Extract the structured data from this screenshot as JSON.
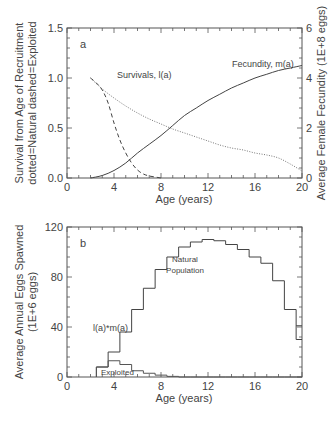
{
  "chart_data": [
    {
      "type": "line",
      "panel_label": "a",
      "xlabel": "Age (years)",
      "ylabel_line1": "Survival from Age of Recruitment",
      "ylabel_line2": "dotted=Natural  dashed=Exploited",
      "ylabel_right": "Average Female Fecundity (1E+8 eggs)",
      "xlim": [
        0,
        20
      ],
      "ylim": [
        0,
        1.5
      ],
      "ylim_right": [
        0,
        6
      ],
      "x_ticks": [
        "0",
        "4",
        "8",
        "12",
        "16",
        "20"
      ],
      "y_ticks": [
        "0.0",
        "0.5",
        "1.0",
        "1.5"
      ],
      "y_ticks_right": [
        "0",
        "2",
        "4",
        "6"
      ],
      "annotations": {
        "survivals": "Survivals, l(a)",
        "fecundity": "Fecundity, m(a)"
      },
      "series": [
        {
          "name": "Natural survival (dotted)",
          "axis": "left",
          "style": "dotted",
          "x": [
            2,
            3,
            4,
            5,
            6,
            7,
            8,
            9,
            10,
            11,
            12,
            13,
            14,
            15,
            16,
            17,
            18,
            19,
            20
          ],
          "values": [
            1.0,
            0.89,
            0.8,
            0.72,
            0.65,
            0.59,
            0.54,
            0.49,
            0.45,
            0.41,
            0.37,
            0.33,
            0.3,
            0.28,
            0.25,
            0.23,
            0.2,
            0.14,
            0.07
          ]
        },
        {
          "name": "Exploited survival (dashed)",
          "axis": "left",
          "style": "dashed",
          "x": [
            2,
            2.5,
            3,
            3.5,
            4,
            4.5,
            5,
            5.5,
            6,
            6.5,
            7,
            7.5,
            8
          ],
          "values": [
            1.0,
            0.95,
            0.88,
            0.75,
            0.55,
            0.38,
            0.25,
            0.15,
            0.08,
            0.04,
            0.02,
            0.01,
            0.0
          ]
        },
        {
          "name": "Fecundity m(a) (solid)",
          "axis": "right",
          "style": "solid",
          "x": [
            2,
            3,
            4,
            5,
            6,
            7,
            8,
            9,
            10,
            11,
            12,
            13,
            14,
            15,
            16,
            17,
            18,
            19,
            20
          ],
          "values": [
            0.0,
            0.1,
            0.3,
            0.6,
            1.0,
            1.35,
            1.7,
            2.1,
            2.5,
            2.8,
            3.1,
            3.35,
            3.6,
            3.8,
            4.0,
            4.15,
            4.3,
            4.4,
            4.5
          ]
        }
      ]
    },
    {
      "type": "bar",
      "subtype": "step-histogram",
      "panel_label": "b",
      "xlabel": "Age (years)",
      "ylabel_line1": "Average Annual Eggs Spawned",
      "ylabel_line2": "(1E+6 eggs)",
      "xlim": [
        0,
        20
      ],
      "ylim": [
        0,
        120
      ],
      "x_ticks": [
        "0",
        "4",
        "8",
        "12",
        "16",
        "20"
      ],
      "y_ticks": [
        "0",
        "40",
        "80",
        "120"
      ],
      "annotations": {
        "product": "l(a)*m(a)",
        "natural_line1": "Natural",
        "natural_line2": "Population",
        "exploited": "Exploited"
      },
      "categories": [
        3,
        4,
        5,
        6,
        7,
        8,
        9,
        10,
        11,
        12,
        13,
        14,
        15,
        16,
        17,
        18,
        19,
        20
      ],
      "series": [
        {
          "name": "Natural Population",
          "values": [
            8,
            20,
            36,
            54,
            71,
            86,
            96,
            104,
            108,
            110,
            109,
            106,
            102,
            96,
            91,
            77,
            54,
            30
          ]
        },
        {
          "name": "Exploited",
          "values": [
            8,
            13,
            10,
            5,
            3,
            1.5,
            0.5,
            0,
            0,
            0,
            0,
            0,
            0,
            0,
            0,
            0,
            0,
            0
          ]
        }
      ],
      "notch_at_20": 41
    }
  ]
}
